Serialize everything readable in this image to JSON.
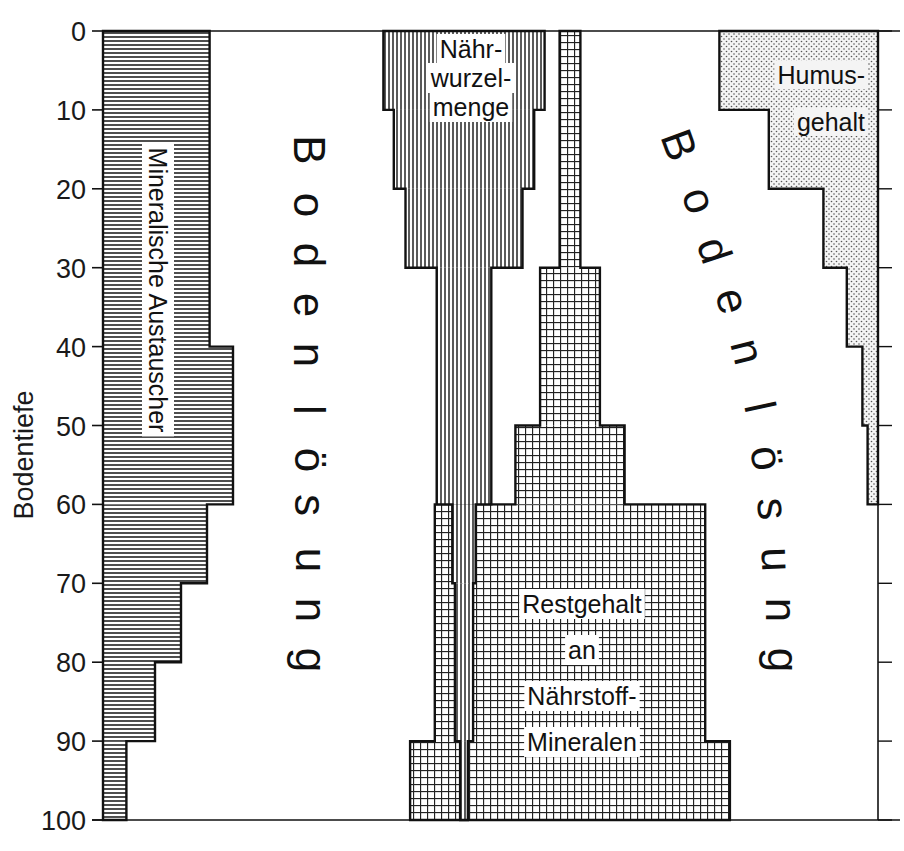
{
  "chart_data": {
    "type": "area",
    "title": "",
    "ylabel": "Bodentiefe",
    "xlabel": "",
    "y_axis": {
      "ticks": [
        0,
        10,
        20,
        30,
        40,
        50,
        60,
        70,
        80,
        90,
        100
      ],
      "range": [
        0,
        100
      ],
      "inverted": true
    },
    "grid": false,
    "series": [
      {
        "name": "Mineralische Austauscher",
        "pattern": "horizontal-lines",
        "anchor": "left",
        "depth_bands": [
          [
            0,
            40
          ],
          [
            40,
            60
          ],
          [
            60,
            70
          ],
          [
            70,
            80
          ],
          [
            80,
            90
          ],
          [
            90,
            100
          ]
        ],
        "relative_amount": [
          4.1,
          5.0,
          4.0,
          3.0,
          2.0,
          0.9
        ]
      },
      {
        "name": "Nährwurzelmenge",
        "pattern": "vertical-lines",
        "anchor": "center",
        "depth_bands": [
          [
            0,
            10
          ],
          [
            10,
            20
          ],
          [
            20,
            30
          ],
          [
            30,
            60
          ],
          [
            60,
            70
          ],
          [
            70,
            90
          ],
          [
            90,
            100
          ]
        ],
        "relative_amount": [
          6.2,
          5.4,
          4.5,
          2.1,
          0.9,
          0.7,
          0.3
        ]
      },
      {
        "name": "Restgehalt an Nährstoff-Mineralen",
        "pattern": "grid",
        "anchor": "center",
        "depth_bands": [
          [
            0,
            30
          ],
          [
            30,
            50
          ],
          [
            50,
            60
          ],
          [
            60,
            90
          ],
          [
            90,
            100
          ]
        ],
        "relative_amount": [
          0.8,
          2.3,
          4.2,
          10.4,
          12.3
        ]
      },
      {
        "name": "Humusgehalt",
        "pattern": "dots",
        "anchor": "right",
        "depth_bands": [
          [
            0,
            10
          ],
          [
            10,
            20
          ],
          [
            20,
            30
          ],
          [
            30,
            40
          ],
          [
            40,
            50
          ],
          [
            50,
            60
          ]
        ],
        "relative_amount": [
          6.1,
          4.2,
          2.1,
          1.2,
          0.6,
          0.4
        ]
      }
    ],
    "annotations": [
      "Bodenlösung",
      "Bodenlösung"
    ]
  },
  "labels": {
    "ylabel": "Bodentiefe",
    "mineral": "Mineralische  Austauscher",
    "wurzel": [
      "Nähr-",
      "wurzel-",
      "menge"
    ],
    "rest": [
      "Restgehalt",
      "an",
      "Nährstoff-",
      "Mineralen"
    ],
    "humus": [
      "Humus-",
      "gehalt"
    ],
    "bodenloesung_left": [
      "B",
      "o",
      "d",
      "e",
      "n",
      "l",
      "ö",
      "s",
      "u",
      "n",
      "g"
    ],
    "bodenloesung_right": [
      "B",
      "o",
      "d",
      "e",
      "n",
      "l",
      "ö",
      "s",
      "u",
      "n",
      "g"
    ]
  }
}
